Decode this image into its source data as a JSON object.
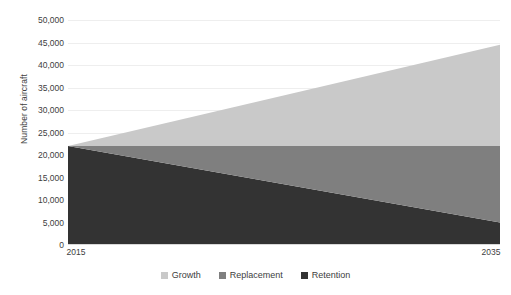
{
  "chart_data": {
    "type": "area",
    "title": "",
    "subtitle": "",
    "xlabel": "",
    "ylabel": "Number of aircraft",
    "x": [
      2015,
      2035
    ],
    "xtick_labels": [
      "2015",
      "2035"
    ],
    "xlim": [
      2015,
      2035
    ],
    "ylim": [
      0,
      50000
    ],
    "ytick_labels": [
      "50,000",
      "45,000",
      "40,000",
      "35,000",
      "30,000",
      "25,000",
      "20,000",
      "15,000",
      "10,000",
      "5,000",
      "0"
    ],
    "ytick_values": [
      50000,
      45000,
      40000,
      35000,
      30000,
      25000,
      20000,
      15000,
      10000,
      5000,
      0
    ],
    "grid": true,
    "stacked": true,
    "stack_order_bottom_to_top": [
      "Retention",
      "Replacement",
      "Growth"
    ],
    "legend_position": "bottom",
    "series": [
      {
        "name": "Growth",
        "color": "#c9c9c9",
        "values": [
          0,
          22500
        ]
      },
      {
        "name": "Replacement",
        "color": "#7f7f7f",
        "values": [
          0,
          17000
        ]
      },
      {
        "name": "Retention",
        "color": "#333333",
        "values": [
          22000,
          5000
        ]
      }
    ],
    "cumulative_tops": {
      "Retention": [
        22000,
        5000
      ],
      "Replacement": [
        22000,
        22000
      ],
      "Growth": [
        22000,
        44500
      ]
    }
  },
  "legend": {
    "items": [
      {
        "label": "Growth",
        "color": "#c9c9c9"
      },
      {
        "label": "Replacement",
        "color": "#7f7f7f"
      },
      {
        "label": "Retention",
        "color": "#333333"
      }
    ]
  },
  "axes": {
    "y_title": "Number of aircraft"
  },
  "colors": {
    "growth": "#c9c9c9",
    "replacement": "#7f7f7f",
    "retention": "#333333",
    "gridline": "#eeeeee",
    "axis": "#d9d9d9",
    "text": "#404040",
    "background": "#ffffff"
  }
}
